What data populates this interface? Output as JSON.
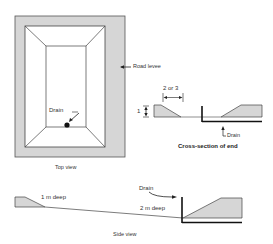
{
  "top_view": {
    "caption": "Top view",
    "drain_label": "Drain",
    "levee_label": "Road levee"
  },
  "cross_section": {
    "caption": "Cross-section of end",
    "width_label": "2 or 3",
    "height_label": "1",
    "drain_label": "Drain"
  },
  "side_view": {
    "caption": "Side view",
    "shallow_label": "1 m deep",
    "deep_label": "2 m deep",
    "drain_label": "Drain"
  },
  "colors": {
    "levee_fill": "#d6d6d6",
    "line": "#222222",
    "background": "#ffffff"
  }
}
